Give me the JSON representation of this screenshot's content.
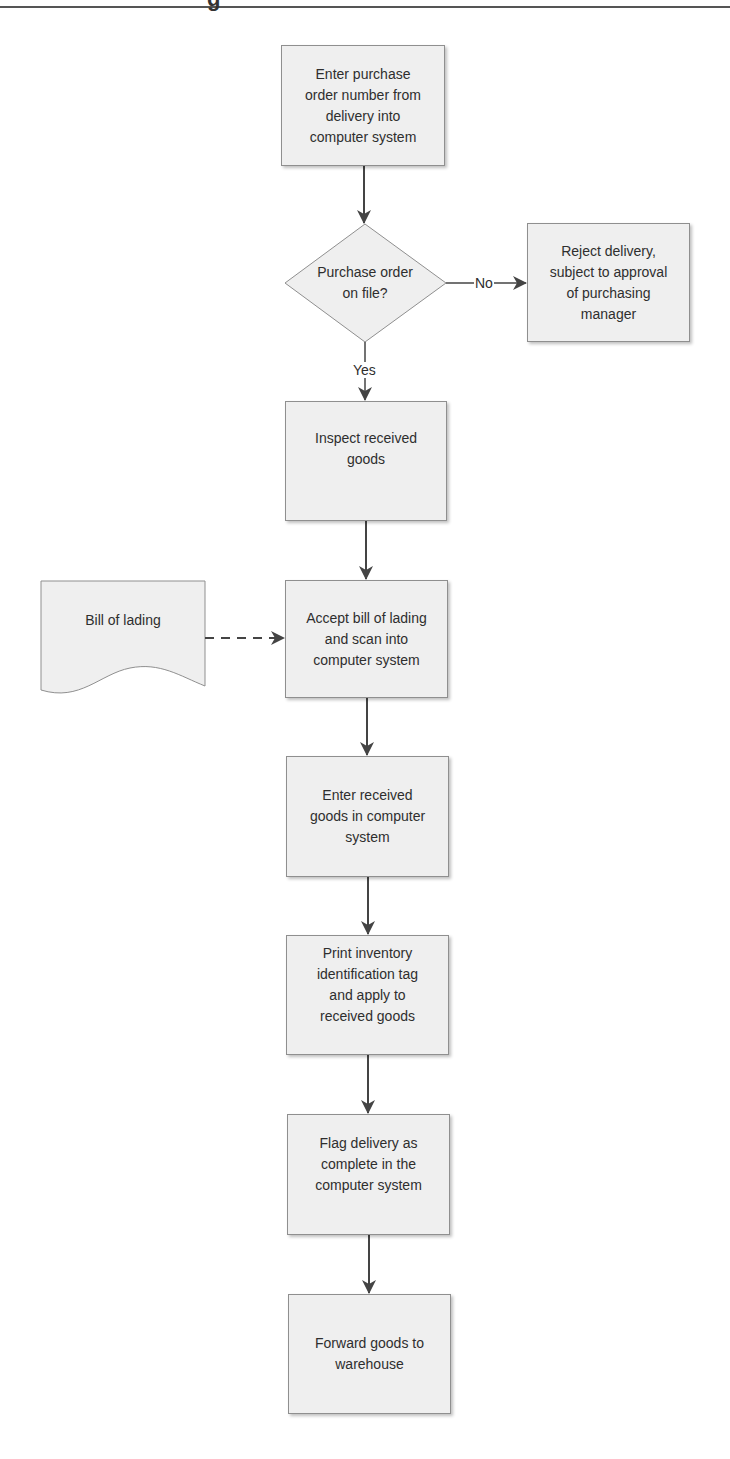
{
  "header": {
    "partial_glyph": "g"
  },
  "flowchart": {
    "title": "",
    "nodes": {
      "n1": {
        "type": "process",
        "text": "Enter purchase\norder number from\ndelivery into\ncomputer system"
      },
      "d1": {
        "type": "decision",
        "text": "Purchase order\non file?"
      },
      "r1": {
        "type": "process",
        "text": "Reject delivery,\nsubject to approval\nof purchasing\nmanager"
      },
      "n2": {
        "type": "process",
        "text": "Inspect received\ngoods"
      },
      "doc": {
        "type": "document",
        "text": "Bill of lading"
      },
      "n3": {
        "type": "process",
        "text": "Accept bill of lading\nand scan into\ncomputer system"
      },
      "n4": {
        "type": "process",
        "text": "Enter received\ngoods in computer\nsystem"
      },
      "n5": {
        "type": "process",
        "text": "Print inventory\nidentification tag\nand apply to\nreceived goods"
      },
      "n6": {
        "type": "process",
        "text": "Flag delivery as\ncomplete in the\ncomputer system"
      },
      "n7": {
        "type": "process",
        "text": "Forward goods to\nwarehouse"
      }
    },
    "edges": {
      "no_label": "No",
      "yes_label": "Yes"
    },
    "colors": {
      "fill": "#efefef",
      "stroke": "#8f8f8f",
      "arrow": "#444444"
    }
  }
}
